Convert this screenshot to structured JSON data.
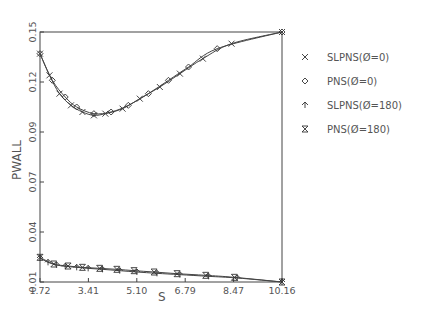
{
  "chart_data": {
    "type": "line",
    "title": "",
    "xlabel": "S",
    "ylabel": "PWALL",
    "xlim": [
      1.72,
      10.16
    ],
    "ylim": [
      0.0,
      0.15
    ],
    "x_ticks": [
      "1.72",
      "3.41",
      "5.10",
      "6.79",
      "8.47",
      "10.16"
    ],
    "y_ticks": [
      "0.01",
      "0.04",
      "0.07",
      "0.09",
      "0.12",
      "0.15"
    ],
    "grid": false,
    "legend_position": "right",
    "series": [
      {
        "name": "SLPNS(Ø=0)",
        "marker": "x",
        "x": [
          1.72,
          2.05,
          2.4,
          2.8,
          3.2,
          3.6,
          4.0,
          4.6,
          5.2,
          5.9,
          6.6,
          7.4,
          8.4,
          10.16
        ],
        "y": [
          0.137,
          0.124,
          0.113,
          0.106,
          0.102,
          0.1,
          0.101,
          0.104,
          0.11,
          0.117,
          0.125,
          0.134,
          0.143,
          0.15
        ]
      },
      {
        "name": "PNS(Ø=0)",
        "marker": "diamond",
        "x": [
          1.72,
          2.15,
          2.6,
          3.0,
          3.6,
          4.2,
          4.8,
          5.5,
          6.2,
          6.9,
          7.9,
          10.16
        ],
        "y": [
          0.137,
          0.121,
          0.111,
          0.105,
          0.101,
          0.102,
          0.106,
          0.113,
          0.121,
          0.129,
          0.14,
          0.15
        ]
      },
      {
        "name": "SLPNS(Ø=180)",
        "marker": "arrow-up",
        "x": [
          1.72,
          2.0,
          2.3,
          2.6,
          3.0,
          3.4,
          3.9,
          4.5,
          5.1,
          5.8,
          6.6,
          7.6,
          8.6,
          10.16
        ],
        "y": [
          0.0144,
          0.0118,
          0.0102,
          0.0094,
          0.0088,
          0.0082,
          0.0076,
          0.0068,
          0.006,
          0.0052,
          0.0044,
          0.0034,
          0.0024,
          0.0
        ]
      },
      {
        "name": "PNS(Ø=180)",
        "marker": "hourglass",
        "x": [
          1.72,
          2.2,
          2.7,
          3.2,
          3.8,
          4.4,
          5.0,
          5.7,
          6.5,
          7.5,
          8.5,
          10.16
        ],
        "y": [
          0.0148,
          0.0108,
          0.0096,
          0.0088,
          0.0082,
          0.0076,
          0.0068,
          0.006,
          0.005,
          0.004,
          0.0028,
          0.0
        ]
      }
    ]
  },
  "legend": {
    "items": [
      {
        "label": "SLPNS(Ø=0)",
        "marker": "x"
      },
      {
        "label": "PNS(Ø=0)",
        "marker": "diamond"
      },
      {
        "label": "SLPNS(Ø=180)",
        "marker": "arrow-up"
      },
      {
        "label": "PNS(Ø=180)",
        "marker": "hourglass"
      }
    ]
  },
  "axes": {
    "xlabel": "S",
    "ylabel": "PWALL"
  }
}
